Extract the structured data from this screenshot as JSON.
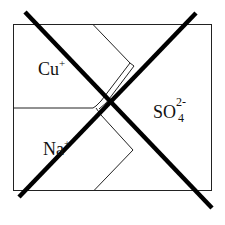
{
  "diagram": {
    "type": "electrochemical-cell-membrane",
    "crossed_out": true,
    "colors": {
      "line": "#222222",
      "cross": "#000000",
      "background": "#ffffff"
    },
    "labels": {
      "cu": {
        "base": "Cu",
        "charge": "+"
      },
      "na": {
        "base": "Na",
        "charge": "+"
      },
      "sulfate": {
        "base": "SO",
        "charge": "2-",
        "subscript": "4"
      }
    }
  }
}
